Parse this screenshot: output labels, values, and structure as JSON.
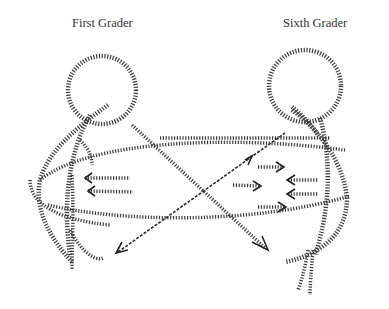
{
  "figure": {
    "type": "sketch-diagram",
    "labels": {
      "left": "First Grader",
      "right": "Sixth Grader"
    },
    "style": {
      "stroke_color": "#3a3a3a",
      "background": "#ffffff"
    }
  }
}
